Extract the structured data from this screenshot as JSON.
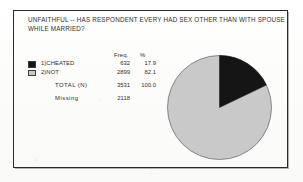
{
  "figure": {
    "title_line_1": "UNFAITHFUL -- HAS RESPONDENT EVERY HAD SEX OTHER THAN WITH SPOUSE",
    "title_line_2": "WHILE MARRIED?",
    "frame_color": "#2b2b2b",
    "background_color": "#fdfdfc"
  },
  "table": {
    "header_freq": "Freq.",
    "header_pct": "%",
    "rows": [
      {
        "label": "1)CHEATED",
        "freq": "632",
        "pct": "17.9",
        "swatch": "black",
        "color": "#151515"
      },
      {
        "label": "2)NOT",
        "freq": "2899",
        "pct": "82.1",
        "swatch": "gray",
        "color": "#c9c9c9"
      }
    ],
    "total": {
      "label": "TOTAL  (N)",
      "freq": "3531",
      "pct": "100.0"
    },
    "missing": {
      "label": "Missing",
      "freq": "2118",
      "pct": ""
    }
  },
  "chart_data": {
    "type": "pie",
    "title": "UNFAITHFUL -- HAS RESPONDENT EVERY HAD SEX OTHER THAN WITH SPOUSE WHILE MARRIED?",
    "categories": [
      "1)CHEATED",
      "2)NOT"
    ],
    "values": [
      632,
      2899
    ],
    "percentages": [
      17.9,
      82.1
    ],
    "colors": [
      "#151515",
      "#c9c9c9"
    ],
    "total_n": 3531,
    "total_percent": 100.0,
    "missing": 2118,
    "start_angle_deg": 0,
    "direction": "clockwise",
    "legend_position": "left",
    "grid": false,
    "xlabel": "",
    "ylabel": ""
  }
}
